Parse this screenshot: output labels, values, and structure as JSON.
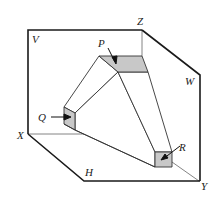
{
  "diagram": {
    "planes": {
      "vertical": "V",
      "side": "W",
      "horizontal": "H"
    },
    "axes": {
      "z": "Z",
      "x": "X",
      "y": "Y"
    },
    "faces": {
      "p": "P",
      "q": "Q",
      "r": "R"
    },
    "colors": {
      "line": "#1a1a1a",
      "thin_line": "#555555",
      "face_fill": "#c8c8c8",
      "background": "#ffffff"
    }
  }
}
